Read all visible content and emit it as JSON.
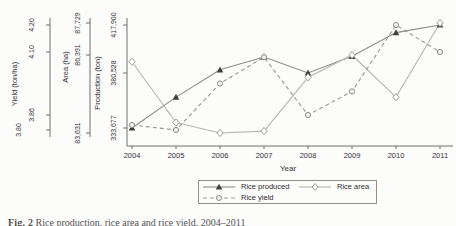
{
  "figure": {
    "caption_label": "Fig. 2",
    "caption_text": "Rice production, rice area and rice yield, 2004–2011"
  },
  "chart_data": {
    "type": "line",
    "x": [
      2004,
      2005,
      2006,
      2007,
      2008,
      2009,
      2010,
      2011
    ],
    "xlabel": "Year",
    "series": [
      {
        "name": "Rice produced",
        "slug": "rice-produced",
        "axis": "production",
        "unit": "ton",
        "values": [
          333677,
          360000,
          383000,
          393000,
          380528,
          393500,
          412000,
          417900
        ],
        "line": "solid",
        "marker": "triangle-filled",
        "line_color": "#8c8c8c",
        "marker_color": "#3f3f3f"
      },
      {
        "name": "Rice area",
        "slug": "rice-area",
        "axis": "area",
        "unit": "ha",
        "values": [
          86150,
          84000,
          83631,
          83700,
          85600,
          86391,
          84900,
          87729
        ],
        "line": "solid",
        "marker": "diamond-open",
        "line_color": "#b5b5b5",
        "marker_color": "#9e9e9e"
      },
      {
        "name": "Rice yield",
        "slug": "rice-yield",
        "axis": "yield",
        "unit": "ton/ha",
        "values": [
          3.82,
          3.8,
          3.98,
          4.08,
          3.86,
          3.95,
          4.2,
          4.1
        ],
        "line": "dashed",
        "marker": "circle-open",
        "line_color": "#979797",
        "marker_color": "#8d8d8d"
      }
    ],
    "axes": {
      "yield": {
        "title": "Yield (ton/ha)",
        "tick_labels": [
          "3.80",
          "3.86",
          "4.10",
          "4.20"
        ],
        "tick_values": [
          3.8,
          3.86,
          4.1,
          4.2
        ]
      },
      "area": {
        "title": "Area (ha)",
        "tick_labels": [
          "83,631",
          "86,391",
          "87,729"
        ],
        "tick_values": [
          83631,
          86391,
          87729
        ]
      },
      "production": {
        "title": "Production (ton)",
        "tick_labels": [
          "333,677",
          "380,528",
          "417,900"
        ],
        "tick_values": [
          333677,
          380528,
          417900
        ]
      }
    },
    "legend": [
      {
        "label": "Rice produced",
        "series": "Rice produced",
        "pos": "pos-produced"
      },
      {
        "label": "Rice yield",
        "series": "Rice yield",
        "pos": "pos-yield"
      },
      {
        "label": "Rice area",
        "series": "Rice area",
        "pos": "pos-area"
      }
    ],
    "layout_hints": {
      "svg_w": 456,
      "svg_h": 176,
      "x0": 132,
      "dx": 44,
      "x_axis_y": 146,
      "x_axis_x1": 127,
      "x_axis_x2": 453,
      "year_label_y": 152,
      "xlabel_x": 288,
      "xlabel_y": 164,
      "axes": {
        "yield": {
          "x": 50,
          "y_top": 18,
          "y_bottom": 137,
          "title_x": 17,
          "title_y": 84,
          "anchors": [
            [
              3.8,
              130
            ],
            [
              3.86,
              115
            ],
            [
              4.1,
              52
            ],
            [
              4.2,
              25
            ]
          ],
          "tick_label_x": [
            21,
            34,
            34,
            34
          ]
        },
        "area": {
          "x": 90,
          "y_top": 18,
          "y_bottom": 137,
          "title_x": 68,
          "title_y": 67,
          "anchors": [
            [
              83631,
              133
            ],
            [
              86391,
              55
            ],
            [
              87729,
              23
            ]
          ],
          "tick_label_x": [
            80,
            80,
            80
          ]
        },
        "production": {
          "x": 127,
          "y_top": 18,
          "y_bottom": 146,
          "title_x": 100,
          "title_y": 83,
          "anchors": [
            [
              333677,
              128
            ],
            [
              380528,
              73
            ],
            [
              417900,
              25
            ]
          ],
          "tick_label_x": [
            116,
            116,
            116
          ]
        }
      }
    }
  }
}
